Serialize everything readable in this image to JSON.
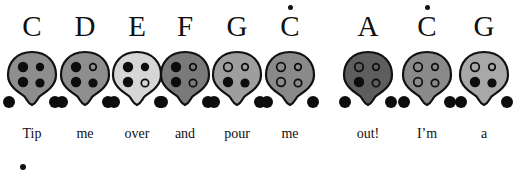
{
  "chart_data": {
    "type": "diagram",
    "notes": [
      {
        "label": "C",
        "high": false,
        "lyric": "Tip",
        "x": 32,
        "body_color": "#8e8e8e",
        "holes": [
          1,
          1,
          1,
          1
        ]
      },
      {
        "label": "D",
        "high": false,
        "lyric": "me",
        "x": 85,
        "body_color": "#8e8e8e",
        "holes": [
          1,
          0,
          1,
          1
        ]
      },
      {
        "label": "E",
        "high": false,
        "lyric": "over",
        "x": 137,
        "body_color": "#d6d6d6",
        "holes": [
          1,
          1,
          1,
          0
        ]
      },
      {
        "label": "F",
        "high": false,
        "lyric": "and",
        "x": 185,
        "body_color": "#7a7a7a",
        "holes": [
          1,
          0,
          1,
          0
        ]
      },
      {
        "label": "G",
        "high": false,
        "lyric": "pour",
        "x": 237,
        "body_color": "#9e9e9e",
        "holes": [
          0,
          0,
          1,
          1
        ]
      },
      {
        "label": "C",
        "high": true,
        "lyric": "me",
        "x": 290,
        "body_color": "#8a8a8a",
        "holes": [
          0,
          0,
          0,
          0
        ]
      },
      {
        "label": "A",
        "high": false,
        "lyric": "out!",
        "x": 368,
        "body_color": "#5e5e5e",
        "holes": [
          0,
          0,
          1,
          0
        ]
      },
      {
        "label": "C",
        "high": true,
        "lyric": "I’m",
        "x": 427,
        "body_color": "#8a8a8a",
        "holes": [
          0,
          0,
          0,
          0
        ]
      },
      {
        "label": "G",
        "high": false,
        "lyric": "a",
        "x": 484,
        "body_color": "#a8a8a8",
        "holes": [
          0,
          0,
          1,
          1
        ]
      }
    ],
    "hole_order": [
      "top-left",
      "top-right",
      "bottom-left",
      "bottom-right"
    ],
    "legend": {
      "filled": "covered hole",
      "open": "uncovered hole",
      "dot_above": "high octave"
    }
  },
  "bullet": "•"
}
